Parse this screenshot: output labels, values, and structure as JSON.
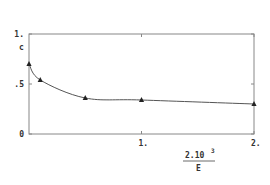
{
  "chart_data": {
    "type": "line",
    "title": "",
    "xlabel": "2.10^3 / E",
    "xlabel_numerator": "2.10",
    "xlabel_exponent": "3",
    "xlabel_denominator": "E",
    "ylabel": "c",
    "xlim": [
      0,
      2
    ],
    "ylim": [
      0,
      1
    ],
    "x_ticks": [
      {
        "value": 1,
        "label": "1."
      },
      {
        "value": 2,
        "label": "2."
      }
    ],
    "y_ticks": [
      {
        "value": 0,
        "label": "0"
      },
      {
        "value": 0.5,
        "label": ".5"
      },
      {
        "value": 1,
        "label": "1."
      }
    ],
    "grid": false,
    "marker": "triangle",
    "series": [
      {
        "name": "c",
        "x": [
          0.0,
          0.1,
          0.5,
          1.0,
          2.0
        ],
        "y": [
          0.7,
          0.54,
          0.36,
          0.34,
          0.3
        ]
      }
    ]
  }
}
